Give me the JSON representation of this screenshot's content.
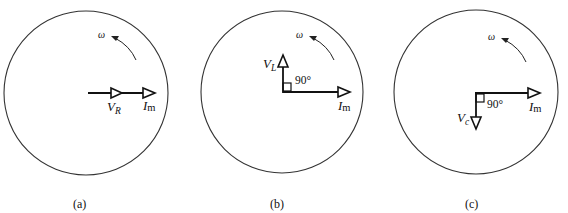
{
  "figure": {
    "rotation_symbol": "ω",
    "current_label": {
      "main": "I",
      "sub": "m"
    },
    "panels": [
      {
        "id": "a",
        "caption": "(a)",
        "element": "resistor",
        "voltage_label": {
          "main": "V",
          "sub": "R"
        },
        "phase_angle": "",
        "voltage_direction": "in phase with current (along +x)"
      },
      {
        "id": "b",
        "caption": "(b)",
        "element": "inductor",
        "voltage_label": {
          "main": "V",
          "sub": "L"
        },
        "phase_angle": "90°",
        "voltage_direction": "leads current by 90° (up)"
      },
      {
        "id": "c",
        "caption": "(c)",
        "element": "capacitor",
        "voltage_label": {
          "main": "V",
          "sub": "c"
        },
        "phase_angle": "90°",
        "voltage_direction": "lags current by 90° (down)"
      }
    ]
  }
}
